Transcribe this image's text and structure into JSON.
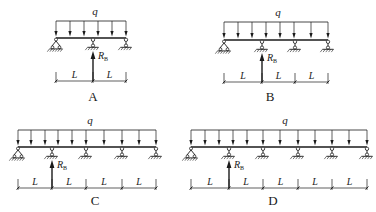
{
  "diagrams": [
    {
      "id": "A",
      "caption": "A",
      "load_label": "q",
      "reaction_label": "R",
      "reaction_sub": "B",
      "span_label": "L",
      "spans": 2,
      "beam": {
        "x1": 56,
        "x2": 126,
        "y": 38
      },
      "supports_x": [
        56,
        93,
        126
      ],
      "pinned_index": 0,
      "reaction_index": 1,
      "load_arrows_x": [
        56,
        70,
        84,
        98,
        112,
        126
      ],
      "load_top_y": 21,
      "dim_y": 81,
      "caption_pos": [
        93,
        101
      ],
      "q_pos": [
        95,
        15
      ]
    },
    {
      "id": "B",
      "caption": "B",
      "load_label": "q",
      "reaction_label": "R",
      "reaction_sub": "B",
      "span_label": "L",
      "spans": 3,
      "beam": {
        "x1": 224,
        "x2": 328,
        "y": 40
      },
      "supports_x": [
        224,
        262,
        295,
        328
      ],
      "pinned_index": 0,
      "reaction_index": 1,
      "load_arrows_x": [
        224,
        238,
        252,
        266,
        280,
        294,
        311,
        328
      ],
      "load_top_y": 22,
      "dim_y": 82,
      "caption_pos": [
        270,
        101
      ],
      "q_pos": [
        278,
        16
      ]
    },
    {
      "id": "C",
      "caption": "C",
      "load_label": "q",
      "reaction_label": "R",
      "reaction_sub": "B",
      "span_label": "L",
      "spans": 4,
      "beam": {
        "x1": 18,
        "x2": 156,
        "y": 147
      },
      "supports_x": [
        18,
        52,
        86,
        122,
        156
      ],
      "pinned_index": 0,
      "reaction_index": 1,
      "load_arrows_x": [
        18,
        31,
        45,
        58,
        72,
        86,
        104,
        122,
        139,
        156
      ],
      "load_top_y": 130,
      "dim_y": 188,
      "caption_pos": [
        95,
        205
      ],
      "q_pos": [
        90,
        124
      ]
    },
    {
      "id": "D",
      "caption": "D",
      "load_label": "q",
      "reaction_label": "R",
      "reaction_sub": "B",
      "span_label": "L",
      "spans": 5,
      "beam": {
        "x1": 191,
        "x2": 367,
        "y": 147
      },
      "supports_x": [
        191,
        229,
        263,
        298,
        332,
        367
      ],
      "pinned_index": 0,
      "reaction_index": 1,
      "load_arrows_x": [
        191,
        205,
        219,
        233,
        247,
        263,
        280,
        298,
        315,
        332,
        349,
        367
      ],
      "load_top_y": 130,
      "dim_y": 188,
      "caption_pos": [
        273,
        205
      ],
      "q_pos": [
        285,
        124
      ]
    }
  ],
  "colors": {
    "line": "#1a1a1a",
    "background": "#ffffff"
  }
}
